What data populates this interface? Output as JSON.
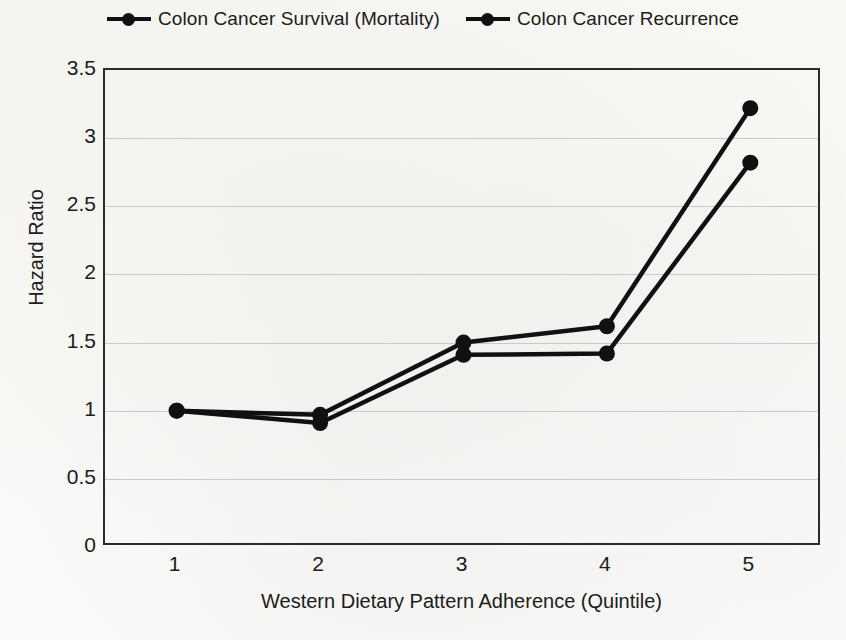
{
  "chart_data": {
    "type": "line",
    "title": "",
    "xlabel": "Western Dietary Pattern Adherence (Quintile)",
    "ylabel": "Hazard Ratio",
    "categories": [
      "1",
      "2",
      "3",
      "4",
      "5"
    ],
    "x": [
      1,
      2,
      3,
      4,
      5
    ],
    "xlim": [
      0.5,
      5.5
    ],
    "ylim": [
      0,
      3.5
    ],
    "yticks": [
      "0",
      "0.5",
      "1",
      "1.5",
      "2",
      "2.5",
      "3",
      "3.5"
    ],
    "ytick_values": [
      0,
      0.5,
      1,
      1.5,
      2,
      2.5,
      3,
      3.5
    ],
    "xticks": [
      "1",
      "2",
      "3",
      "4",
      "5"
    ],
    "grid": "horizontal",
    "legend_position": "top-center",
    "series": [
      {
        "name": "Colon Cancer Survival (Mortality)",
        "color": "#111111",
        "marker": "circle",
        "values": [
          1.0,
          0.97,
          1.5,
          1.62,
          3.22
        ]
      },
      {
        "name": "Colon Cancer Recurrence",
        "color": "#111111",
        "marker": "circle",
        "values": [
          1.0,
          0.91,
          1.41,
          1.42,
          2.82
        ]
      }
    ]
  },
  "legend": {
    "items": [
      {
        "label": "Colon Cancer Survival (Mortality)"
      },
      {
        "label": "Colon Cancer Recurrence"
      }
    ]
  },
  "axes": {
    "y_title": "Hazard Ratio",
    "x_title": "Western Dietary Pattern Adherence (Quintile)"
  },
  "colors": {
    "series_line": "#111111",
    "gridline": "#c9c9c9",
    "frame": "#2b2b2b",
    "background": "#fbfbf9",
    "text": "#1c1c1c"
  }
}
